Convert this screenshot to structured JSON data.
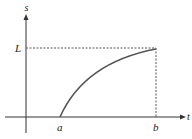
{
  "diagram": {
    "type": "graph-of-increasing-function",
    "axes": {
      "x_label": "t",
      "y_label": "s"
    },
    "markers": {
      "x_start_label": "a",
      "x_end_label": "b",
      "y_level_label": "L"
    },
    "colors": {
      "axis": "#333333",
      "curve": "#555555",
      "dashed": "#555555",
      "text": "#222222"
    }
  }
}
